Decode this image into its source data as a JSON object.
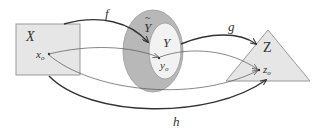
{
  "diagram": {
    "sets": {
      "X": {
        "label": "X",
        "shape": "rectangle",
        "fill": "#e6e6e6",
        "point": {
          "name": "x",
          "sub": "o"
        }
      },
      "Y_closure": {
        "label": "Ỹ",
        "label_base": "Y",
        "label_mark": "~",
        "shape": "ellipse",
        "fill": "#b8b8b8"
      },
      "Y": {
        "label": "Y",
        "shape": "ellipse",
        "fill": "#f2f2f2",
        "point": {
          "name": "y",
          "sub": "o"
        }
      },
      "Z": {
        "label": "Z",
        "shape": "triangle",
        "fill": "#e6e6e6",
        "point": {
          "name": "z",
          "sub": "o"
        }
      }
    },
    "maps": [
      {
        "name": "f",
        "label": "f",
        "from": "X",
        "to": "Y_closure",
        "style": "thick"
      },
      {
        "name": "g",
        "label": "g",
        "from": "Y",
        "to": "Z",
        "style": "thick"
      },
      {
        "name": "h",
        "label": "h",
        "from": "X",
        "to": "Z",
        "style": "thick"
      },
      {
        "name": "x0-to-y0",
        "label": "",
        "from": "x_o",
        "to": "y_o",
        "style": "thin"
      },
      {
        "name": "y0-to-z0",
        "label": "",
        "from": "y_o",
        "to": "z_o",
        "style": "thin"
      },
      {
        "name": "x0-to-z0",
        "label": "",
        "from": "x_o",
        "to": "z_o",
        "style": "thin"
      }
    ],
    "colors": {
      "stroke": "#333333",
      "thin_stroke": "#555555",
      "box_fill": "#e6e6e6",
      "ring_fill": "#b8b8b8",
      "inner_fill": "#f2f2f2"
    }
  }
}
